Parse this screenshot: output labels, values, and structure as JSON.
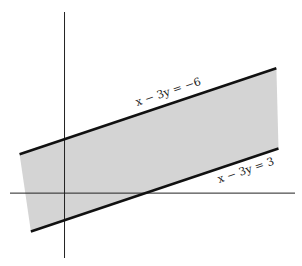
{
  "chart_data": {
    "type": "area",
    "title": "",
    "xlabel": "",
    "ylabel": "",
    "xlim": [
      -2.1,
      8.6
    ],
    "ylim": [
      -2.4,
      6.7
    ],
    "grid": false,
    "axes": {
      "x_axis": true,
      "y_axis": true,
      "ticks": false
    },
    "series": [
      {
        "name": "x − 3y = −6",
        "equation": "x - 3y = -6",
        "points": [
          [
            -1.67,
            1.44
          ],
          [
            7.87,
            4.62
          ]
        ]
      },
      {
        "name": "x − 3y = 3",
        "equation": "x - 3y = 3",
        "points": [
          [
            -1.25,
            -1.42
          ],
          [
            7.95,
            1.65
          ]
        ]
      }
    ],
    "region": {
      "between": [
        "x - 3y = -6",
        "x - 3y = 3"
      ],
      "fill": "#d4d4d4"
    },
    "annotations": [
      {
        "text": "x − 3y = −6",
        "attached_to": "x - 3y = -6",
        "position": "above line, middle"
      },
      {
        "text": "x − 3y = 3",
        "attached_to": "x - 3y = 3",
        "position": "below line, right end"
      }
    ],
    "colors": {
      "line": "#111111",
      "axis": "#222222",
      "fill": "#d4d4d4"
    }
  }
}
